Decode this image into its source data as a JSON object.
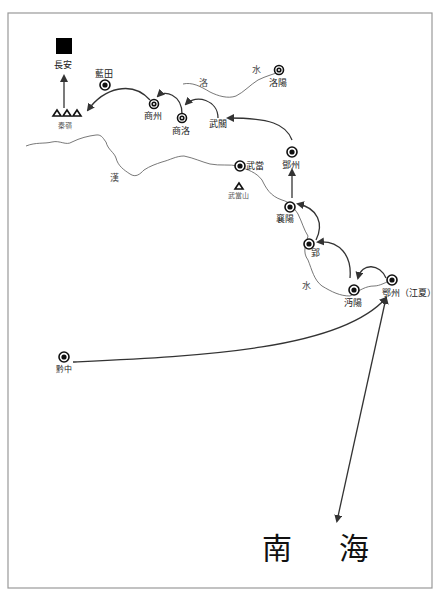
{
  "map": {
    "title": "",
    "colors": {
      "line": "#333333",
      "river": "#555555",
      "frame": "#888888",
      "capital": "#000000"
    },
    "capital": {
      "name": "長安",
      "icon": "capital-square-icon"
    },
    "mountains": [
      {
        "name": "秦嶺",
        "icon": "mountain-triangles-icon"
      },
      {
        "name": "武當山",
        "icon": "mountain-triangle-icon"
      }
    ],
    "places": {
      "lantian": "藍田",
      "shangzhou": "商州",
      "shangluo": "商洛",
      "wuguan": "武關",
      "luoyang": "洛陽",
      "dengzhou": "鄧州",
      "wudang": "武當",
      "xiangyang": "襄陽",
      "ying": "郢",
      "mianyang": "沔陽",
      "ezhou": "鄂州（江夏）",
      "qianzhong": "黔中"
    },
    "rivers": {
      "luo_1": "洛",
      "luo_2": "水",
      "han_1": "漢",
      "han_2": "水"
    },
    "region": {
      "south_sea_1": "南",
      "south_sea_2": "海"
    }
  }
}
